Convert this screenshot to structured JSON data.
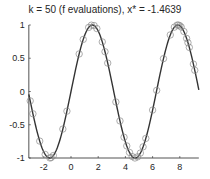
{
  "chart_data": {
    "type": "line",
    "title": "k = 50 (f evaluations), x* = -1.4639",
    "xlabel": "",
    "ylabel": "",
    "xlim": [
      -3.1,
      9.4
    ],
    "ylim": [
      -1,
      1
    ],
    "xticks": [
      "-2",
      "0",
      "2",
      "4",
      "6",
      "8"
    ],
    "yticks": [
      "1",
      "0.5",
      "0",
      "-0.5",
      "-1"
    ],
    "grid": false,
    "series": [
      {
        "name": "f(x) = sin(x)",
        "style": "line",
        "color": "#333333"
      },
      {
        "name": "evaluations",
        "style": "circle-markers",
        "color": "#7f7f7f",
        "x": [
          -3.0,
          -2.8,
          -2.3,
          -1.9,
          -1.55,
          -1.46,
          -1.3,
          -0.6,
          -0.3,
          0.6,
          0.9,
          1.3,
          1.5,
          1.7,
          1.9,
          2.3,
          2.5,
          2.7,
          3.3,
          3.6,
          3.9,
          4.1,
          4.3,
          4.5,
          4.7,
          4.9,
          5.1,
          5.3,
          5.5,
          6.0,
          6.3,
          6.8,
          7.3,
          7.6,
          7.8,
          7.9,
          8.0,
          8.1,
          8.3,
          8.5,
          8.6,
          8.7,
          9.0,
          9.1
        ]
      }
    ]
  },
  "title": "k = 50 (f evaluations), x* = -1.4639"
}
